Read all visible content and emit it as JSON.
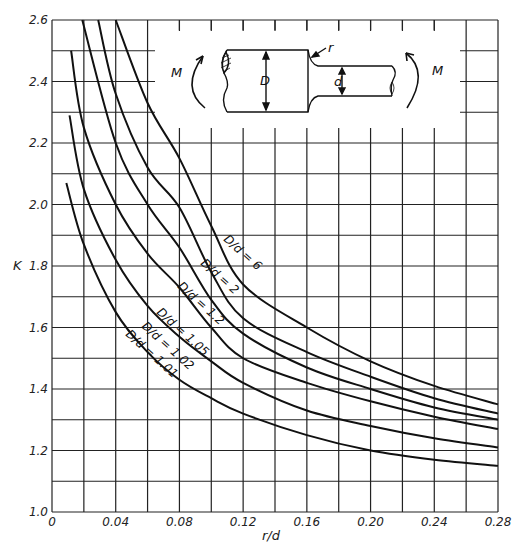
{
  "chart_data": {
    "type": "line",
    "title": "",
    "xlabel": "r/d",
    "ylabel": "K",
    "xlim": [
      0,
      0.28
    ],
    "ylim": [
      1.0,
      2.6
    ],
    "grid": true,
    "x_ticks": [
      "0",
      "0.04",
      "0.08",
      "0.12",
      "0.16",
      "0.20",
      "0.24",
      "0.28"
    ],
    "y_ticks": [
      "1.0",
      "1.2",
      "1.4",
      "1.6",
      "1.8",
      "2.0",
      "2.2",
      "2.4",
      "2.6"
    ],
    "series": [
      {
        "name": "D/d = 6",
        "x": [
          0.04,
          0.06,
          0.08,
          0.1,
          0.12,
          0.16,
          0.2,
          0.24,
          0.28
        ],
        "y": [
          2.6,
          2.33,
          2.15,
          1.93,
          1.74,
          1.6,
          1.49,
          1.41,
          1.35
        ]
      },
      {
        "name": "D/d = 2",
        "x": [
          0.029,
          0.04,
          0.06,
          0.08,
          0.1,
          0.12,
          0.16,
          0.2,
          0.24,
          0.28
        ],
        "y": [
          2.6,
          2.36,
          2.12,
          1.99,
          1.78,
          1.63,
          1.52,
          1.44,
          1.37,
          1.32
        ]
      },
      {
        "name": "D/d = 1.2",
        "x": [
          0.019,
          0.04,
          0.06,
          0.08,
          0.1,
          0.12,
          0.16,
          0.2,
          0.24,
          0.28
        ],
        "y": [
          2.6,
          2.2,
          2.0,
          1.86,
          1.69,
          1.58,
          1.47,
          1.4,
          1.34,
          1.3
        ]
      },
      {
        "name": "D/d = 1.05",
        "x": [
          0.012,
          0.02,
          0.04,
          0.06,
          0.08,
          0.1,
          0.12,
          0.16,
          0.2,
          0.24,
          0.28
        ],
        "y": [
          2.5,
          2.25,
          2.0,
          1.84,
          1.73,
          1.6,
          1.5,
          1.42,
          1.36,
          1.31,
          1.27
        ]
      },
      {
        "name": "D/d = 1.02",
        "x": [
          0.011,
          0.02,
          0.04,
          0.06,
          0.08,
          0.1,
          0.12,
          0.16,
          0.2,
          0.24,
          0.28
        ],
        "y": [
          2.29,
          2.05,
          1.82,
          1.67,
          1.57,
          1.49,
          1.42,
          1.33,
          1.28,
          1.24,
          1.21
        ]
      },
      {
        "name": "D/d = 1.01",
        "x": [
          0.009,
          0.02,
          0.04,
          0.06,
          0.08,
          0.1,
          0.12,
          0.16,
          0.2,
          0.24,
          0.28
        ],
        "y": [
          2.07,
          1.87,
          1.65,
          1.52,
          1.43,
          1.37,
          1.32,
          1.25,
          1.2,
          1.17,
          1.15
        ]
      }
    ],
    "annotations": [
      "D/d = 6",
      "D/d = 2",
      "D/d = 1.2",
      "D/d = 1.05",
      "D/d = 1.02",
      "D/d = 1.01"
    ],
    "inset": {
      "description": "Stepped shaft with shoulder fillet under bending moment M",
      "labels": [
        "M",
        "D",
        "r",
        "d",
        "M"
      ]
    }
  },
  "labels": {
    "xlabel": "r/d",
    "ylabel": "K",
    "inset_M_left": "M",
    "inset_M_right": "M",
    "inset_D": "D",
    "inset_d": "d",
    "inset_r": "r"
  }
}
